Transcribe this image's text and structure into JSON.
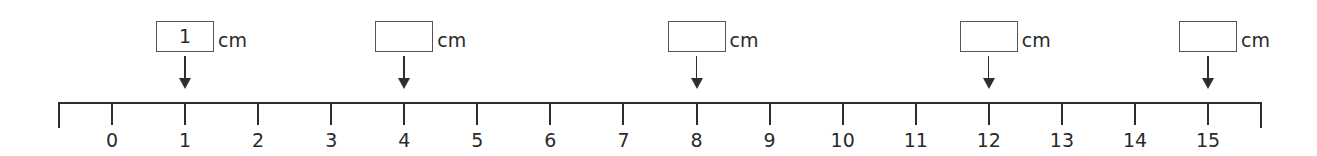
{
  "ruler": {
    "unit": "cm",
    "start_px": 58,
    "end_px": 1260,
    "zero_px": 112,
    "spacing_px": 73.07,
    "ticks": [
      "0",
      "1",
      "2",
      "3",
      "4",
      "5",
      "6",
      "7",
      "8",
      "9",
      "10",
      "11",
      "12",
      "13",
      "14",
      "15"
    ]
  },
  "markers": [
    {
      "position": 1,
      "value": "1",
      "unit": "cm"
    },
    {
      "position": 4,
      "value": "",
      "unit": "cm"
    },
    {
      "position": 8,
      "value": "",
      "unit": "cm"
    },
    {
      "position": 12,
      "value": "",
      "unit": "cm"
    },
    {
      "position": 15,
      "value": "",
      "unit": "cm"
    }
  ],
  "colors": {
    "line": "#2e2e2e",
    "box_border": "#555555",
    "text": "#2a2a2a"
  }
}
